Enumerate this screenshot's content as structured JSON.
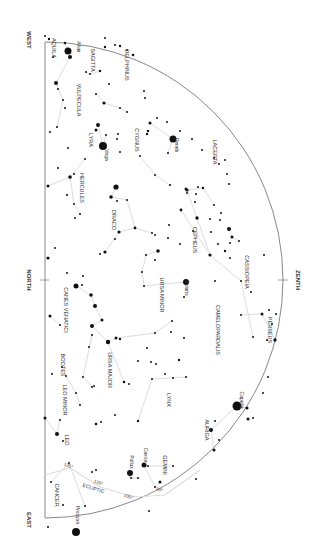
{
  "map": {
    "title": "Star chart (northern horizon, rotated)",
    "horizon": {
      "x": 45,
      "y_west": 42,
      "y_north": 280,
      "y_east": 518
    },
    "zenith": {
      "x": 283,
      "y": 280,
      "radius": 238
    },
    "directions": [
      {
        "label": "WEST",
        "x": 27,
        "y": 40
      },
      {
        "label": "NORTH",
        "x": 27,
        "y": 280
      },
      {
        "label": "EAST",
        "x": 27,
        "y": 520
      },
      {
        "label": "ZENTH",
        "x": 296,
        "y": 280
      }
    ],
    "colors": {
      "horizon": "#888888",
      "lines": "#dddddd",
      "stars": "#111111",
      "text": "#333333"
    },
    "constellations": [
      {
        "label": "AQUILA",
        "x": 52,
        "y": 48
      },
      {
        "label": "SAGITTA",
        "x": 91,
        "y": 60
      },
      {
        "label": "DELPHINUS",
        "x": 125,
        "y": 65
      },
      {
        "label": "VULPECULA",
        "x": 77,
        "y": 100
      },
      {
        "label": "LYRA",
        "x": 89,
        "y": 140
      },
      {
        "label": "CYGNUS",
        "x": 135,
        "y": 140
      },
      {
        "label": "LACERTA",
        "x": 213,
        "y": 152
      },
      {
        "label": "HERCULES",
        "x": 80,
        "y": 188
      },
      {
        "label": "DRACO",
        "x": 112,
        "y": 220
      },
      {
        "label": "CEPHEUS",
        "x": 193,
        "y": 240
      },
      {
        "label": "BOOTES",
        "x": 61,
        "y": 365
      },
      {
        "label": "URSA MINOR",
        "x": 160,
        "y": 295
      },
      {
        "label": "CASSIOPEIA",
        "x": 245,
        "y": 272
      },
      {
        "label": "CANES VENATICI",
        "x": 64,
        "y": 310
      },
      {
        "label": "CAMELOPARDALIS",
        "x": 216,
        "y": 330
      },
      {
        "label": "PERSEUS",
        "x": 268,
        "y": 330
      },
      {
        "label": "URSA MAJOR",
        "x": 108,
        "y": 370
      },
      {
        "label": "LYNX",
        "x": 167,
        "y": 400
      },
      {
        "label": "LEO MINOR",
        "x": 63,
        "y": 400
      },
      {
        "label": "AURIGA",
        "x": 205,
        "y": 430
      },
      {
        "label": "LEO",
        "x": 65,
        "y": 440
      },
      {
        "label": "GEMINI",
        "x": 163,
        "y": 465
      },
      {
        "label": "CANCER",
        "x": 55,
        "y": 495
      }
    ],
    "named_stars": [
      {
        "label": "Altair",
        "x": 77,
        "y": 47,
        "sx": 68,
        "sy": 51,
        "r": 3.5
      },
      {
        "label": "Deneb",
        "x": 175,
        "y": 145,
        "sx": 173,
        "sy": 139,
        "r": 3.5
      },
      {
        "label": "Vega",
        "x": 105,
        "y": 155,
        "sx": 103,
        "sy": 146,
        "r": 4
      },
      {
        "label": "Polaris",
        "x": 185,
        "y": 288,
        "sx": 186,
        "sy": 282,
        "r": 3
      },
      {
        "label": "Capella",
        "x": 240,
        "y": 400,
        "sx": 237,
        "sy": 406,
        "r": 4.5
      },
      {
        "label": "Castor",
        "x": 144,
        "y": 455,
        "sx": 144,
        "sy": 465,
        "r": 2.5
      },
      {
        "label": "Pollux",
        "x": 130,
        "y": 462,
        "sx": 130,
        "sy": 473,
        "r": 3
      },
      {
        "label": "Procyon",
        "x": 76,
        "y": 515,
        "sx": 76,
        "sy": 532,
        "r": 4
      }
    ],
    "ecliptic": {
      "label": "ECLIPTIC",
      "label_x": 93,
      "label_y": 490,
      "points": "45,475 70,468 100,487 135,497 165,495 200,470",
      "ticks": [
        {
          "label": "135°",
          "x": 68,
          "y": 467
        },
        {
          "label": "120°",
          "x": 98,
          "y": 484
        },
        {
          "label": "105°",
          "x": 128,
          "y": 498
        },
        {
          "label": "90°",
          "x": 159,
          "y": 491
        }
      ]
    },
    "stars": [
      [
        45,
        36,
        1
      ],
      [
        49,
        39,
        1.2
      ],
      [
        65,
        43,
        1.2
      ],
      [
        70,
        57,
        2
      ],
      [
        53,
        57,
        1
      ],
      [
        105,
        38,
        1
      ],
      [
        115,
        45,
        1
      ],
      [
        120,
        46,
        1.2
      ],
      [
        127,
        50,
        1
      ],
      [
        133,
        55,
        1.3
      ],
      [
        105,
        47,
        1.2
      ],
      [
        56,
        83,
        2
      ],
      [
        58,
        89,
        1
      ],
      [
        63,
        100,
        1
      ],
      [
        65,
        108,
        1
      ],
      [
        57,
        127,
        1
      ],
      [
        50,
        132,
        1
      ],
      [
        86,
        72,
        1
      ],
      [
        90,
        74,
        1
      ],
      [
        100,
        71,
        1.2
      ],
      [
        109,
        84,
        1
      ],
      [
        96,
        94,
        1
      ],
      [
        104,
        103,
        1.6
      ],
      [
        120,
        108,
        1
      ],
      [
        127,
        112,
        1
      ],
      [
        150,
        123,
        1.5
      ],
      [
        144,
        91,
        1
      ],
      [
        145,
        98,
        1
      ],
      [
        157,
        118,
        1
      ],
      [
        148,
        131,
        1.2
      ],
      [
        98,
        125,
        2
      ],
      [
        96,
        130,
        1.5
      ],
      [
        106,
        135,
        1
      ],
      [
        118,
        134,
        1
      ],
      [
        117,
        139,
        1
      ],
      [
        120,
        152,
        1
      ],
      [
        68,
        148,
        1
      ],
      [
        58,
        168,
        1
      ],
      [
        70,
        177,
        1.8
      ],
      [
        85,
        159,
        1
      ],
      [
        74,
        174,
        1
      ],
      [
        48,
        186,
        1.5
      ],
      [
        67,
        195,
        1.1
      ],
      [
        74,
        204,
        1
      ],
      [
        80,
        214,
        1
      ],
      [
        75,
        218,
        1
      ],
      [
        116,
        187,
        2.6
      ],
      [
        111,
        197,
        1.8
      ],
      [
        117,
        201,
        1
      ],
      [
        127,
        200,
        1
      ],
      [
        135,
        228,
        1.4
      ],
      [
        152,
        233,
        1
      ],
      [
        155,
        235,
        1
      ],
      [
        115,
        239,
        1
      ],
      [
        119,
        232,
        1.6
      ],
      [
        105,
        252,
        1.6
      ],
      [
        100,
        254,
        1
      ],
      [
        147,
        134,
        1.2
      ],
      [
        167,
        122,
        1
      ],
      [
        180,
        131,
        1
      ],
      [
        168,
        153,
        1
      ],
      [
        140,
        156,
        1
      ],
      [
        155,
        175,
        1
      ],
      [
        170,
        185,
        1.1
      ],
      [
        192,
        139,
        1
      ],
      [
        202,
        150,
        1
      ],
      [
        214,
        158,
        1
      ],
      [
        225,
        160,
        1
      ],
      [
        219,
        164,
        1
      ],
      [
        227,
        174,
        1
      ],
      [
        229,
        184,
        1
      ],
      [
        186,
        189,
        1.5
      ],
      [
        187,
        193,
        1
      ],
      [
        195,
        202,
        1
      ],
      [
        187,
        190,
        1.6
      ],
      [
        198,
        187,
        1
      ],
      [
        203,
        188,
        1.2
      ],
      [
        196,
        194,
        1
      ],
      [
        214,
        205,
        1
      ],
      [
        221,
        213,
        1
      ],
      [
        181,
        210,
        1.4
      ],
      [
        197,
        218,
        1.7
      ],
      [
        210,
        219,
        1
      ],
      [
        220,
        220,
        1
      ],
      [
        169,
        225,
        1
      ],
      [
        168,
        238,
        1
      ],
      [
        180,
        244,
        1
      ],
      [
        193,
        231,
        1
      ],
      [
        211,
        232,
        1
      ],
      [
        210,
        255,
        1.6
      ],
      [
        55,
        248,
        1
      ],
      [
        48,
        258,
        1.6
      ],
      [
        67,
        273,
        1
      ],
      [
        83,
        276,
        1
      ],
      [
        82,
        285,
        1
      ],
      [
        229,
        229,
        2
      ],
      [
        232,
        237,
        1.5
      ],
      [
        218,
        244,
        1
      ],
      [
        230,
        243,
        1
      ],
      [
        239,
        241,
        1
      ],
      [
        225,
        251,
        1.2
      ],
      [
        264,
        255,
        1
      ],
      [
        76,
        286,
        2.5
      ],
      [
        91,
        295,
        1.8
      ],
      [
        95,
        306,
        2
      ],
      [
        102,
        320,
        1.5
      ],
      [
        92,
        326,
        2
      ],
      [
        116,
        338,
        1.5
      ],
      [
        108,
        342,
        2.2
      ],
      [
        158,
        251,
        1.8
      ],
      [
        146,
        255,
        1
      ],
      [
        155,
        260,
        1
      ],
      [
        142,
        272,
        1
      ],
      [
        144,
        286,
        1
      ],
      [
        50,
        316,
        1.5
      ],
      [
        60,
        325,
        1
      ],
      [
        52,
        374,
        1
      ],
      [
        89,
        347,
        1
      ],
      [
        92,
        335,
        1
      ],
      [
        83,
        377,
        1
      ],
      [
        92,
        387,
        1
      ],
      [
        94,
        386,
        1
      ],
      [
        120,
        339,
        1.2
      ],
      [
        155,
        333,
        1
      ],
      [
        147,
        348,
        1
      ],
      [
        138,
        361,
        1
      ],
      [
        151,
        362,
        1
      ],
      [
        184,
        297,
        1
      ],
      [
        215,
        281,
        1
      ],
      [
        230,
        258,
        1
      ],
      [
        241,
        281,
        1
      ],
      [
        251,
        292,
        1
      ],
      [
        241,
        315,
        1
      ],
      [
        253,
        337,
        1
      ],
      [
        272,
        324,
        1
      ],
      [
        276,
        314,
        1
      ],
      [
        262,
        314,
        1.5
      ],
      [
        269,
        310,
        1
      ],
      [
        275,
        340,
        1.7
      ],
      [
        267,
        340,
        1
      ],
      [
        172,
        321,
        1
      ],
      [
        171,
        332,
        1
      ],
      [
        184,
        338,
        1
      ],
      [
        179,
        360,
        1.2
      ],
      [
        156,
        364,
        1
      ],
      [
        165,
        374,
        1
      ],
      [
        124,
        382,
        1.3
      ],
      [
        129,
        384,
        1
      ],
      [
        152,
        379,
        1
      ],
      [
        173,
        378,
        1
      ],
      [
        186,
        377,
        1
      ],
      [
        45,
        418,
        1.5
      ],
      [
        60,
        420,
        1
      ],
      [
        57,
        434,
        2
      ],
      [
        63,
        441,
        1
      ],
      [
        62,
        367,
        1
      ],
      [
        66,
        376,
        1
      ],
      [
        76,
        393,
        1
      ],
      [
        80,
        405,
        1
      ],
      [
        96,
        424,
        1.3
      ],
      [
        101,
        422,
        1
      ],
      [
        115,
        415,
        1
      ],
      [
        138,
        421,
        1.2
      ],
      [
        211,
        430,
        2
      ],
      [
        215,
        421,
        1
      ],
      [
        219,
        440,
        1
      ],
      [
        214,
        450,
        1.5
      ],
      [
        247,
        408,
        1.5
      ],
      [
        248,
        419,
        1.5
      ],
      [
        253,
        418,
        1
      ],
      [
        173,
        466,
        1
      ],
      [
        148,
        466,
        1
      ],
      [
        131,
        478,
        1
      ],
      [
        138,
        478,
        1
      ],
      [
        155,
        487,
        1
      ],
      [
        160,
        482,
        1.5
      ],
      [
        149,
        511,
        1
      ],
      [
        96,
        470,
        1
      ],
      [
        69,
        463,
        1
      ],
      [
        51,
        482,
        1
      ],
      [
        63,
        505,
        1
      ],
      [
        48,
        527,
        1
      ],
      [
        85,
        506,
        1
      ],
      [
        92,
        472,
        1
      ],
      [
        196,
        479,
        1
      ],
      [
        263,
        393,
        1
      ],
      [
        268,
        377,
        1
      ]
    ],
    "lines": [
      "65,43 70,57 56,83 63,100 57,127",
      "86,72 90,74 100,71",
      "96,94 104,103 120,108 127,112",
      "150,123 173,139 168,153",
      "98,125 103,146 106,135",
      "140,156 155,175 170,185",
      "48,186 70,177 85,159",
      "70,177 74,204 80,214",
      "116,187 111,197 127,200 135,228 152,233",
      "135,228 119,232 105,252",
      "187,190 197,218 210,255 181,210",
      "187,190 203,188 214,205",
      "229,229 232,237 239,241",
      "76,286 91,295 95,306 102,320 92,326 108,342 116,338",
      "108,342 124,382",
      "116,338 155,333 172,321",
      "158,251 146,255 142,272 144,286 186,282",
      "210,255 241,281 253,337",
      "241,315 262,314 275,340",
      "50,316 60,325",
      "89,347 92,335 83,377 92,387",
      "138,421 152,379 186,377",
      "211,430 237,406 247,408",
      "211,430 214,450",
      "60,420 57,434",
      "62,367 66,376 76,393 80,405",
      "144,465 155,487 160,482",
      "130,473 131,478 138,478",
      "69,463 51,482",
      "69,463 85,506",
      "148,466 173,466",
      "45,418 57,434"
    ]
  }
}
